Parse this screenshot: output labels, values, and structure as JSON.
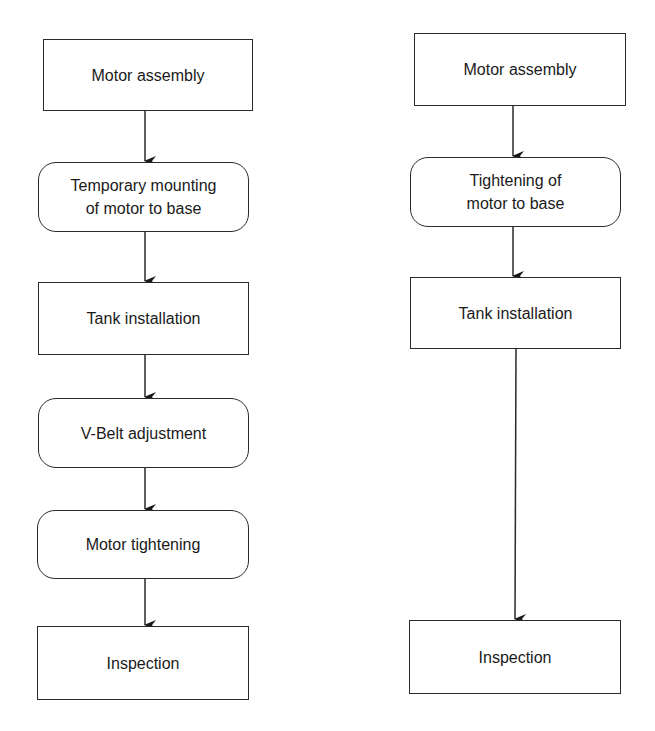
{
  "diagram": {
    "left": {
      "nodes": [
        {
          "id": "L1",
          "label": "Motor assembly",
          "shape": "rectangle"
        },
        {
          "id": "L2",
          "label": "Temporary mounting\nof motor to base",
          "shape": "rounded"
        },
        {
          "id": "L3",
          "label": "Tank installation",
          "shape": "rectangle"
        },
        {
          "id": "L4",
          "label": "V-Belt adjustment",
          "shape": "rounded"
        },
        {
          "id": "L5",
          "label": "Motor tightening",
          "shape": "rounded"
        },
        {
          "id": "L6",
          "label": "Inspection",
          "shape": "rectangle"
        }
      ],
      "edges": [
        [
          "L1",
          "L2"
        ],
        [
          "L2",
          "L3"
        ],
        [
          "L3",
          "L4"
        ],
        [
          "L4",
          "L5"
        ],
        [
          "L5",
          "L6"
        ]
      ]
    },
    "right": {
      "nodes": [
        {
          "id": "R1",
          "label": "Motor assembly",
          "shape": "rectangle"
        },
        {
          "id": "R2",
          "label": "Tightening of\nmotor to base",
          "shape": "rounded"
        },
        {
          "id": "R3",
          "label": "Tank installation",
          "shape": "rectangle"
        },
        {
          "id": "R4",
          "label": "Inspection",
          "shape": "rectangle"
        }
      ],
      "edges": [
        [
          "R1",
          "R2"
        ],
        [
          "R2",
          "R3"
        ],
        [
          "R3",
          "R4"
        ]
      ]
    },
    "colors": {
      "stroke": "#2a2a2a",
      "fill": "#ffffff",
      "text": "#1a1a1a"
    }
  }
}
